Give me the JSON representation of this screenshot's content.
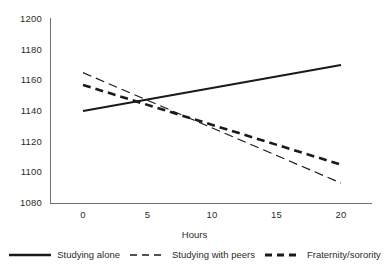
{
  "chart_data": {
    "type": "line",
    "title": "",
    "subtitle": "",
    "xlabel": "Hours",
    "ylabel": "",
    "xlim": [
      -1.5,
      22
    ],
    "ylim": [
      1080,
      1200
    ],
    "grid": false,
    "legend_position": "bottom",
    "x_ticks": [
      "0",
      "5",
      "10",
      "15",
      "20"
    ],
    "x_tick_values": [
      0,
      5,
      10,
      15,
      20
    ],
    "y_ticks": [
      "1080",
      "1100",
      "1120",
      "1140",
      "1160",
      "1180",
      "1200"
    ],
    "y_tick_values": [
      1080,
      1100,
      1120,
      1140,
      1160,
      1180,
      1200
    ],
    "x": [
      0,
      20
    ],
    "series": [
      {
        "name": "Studying alone",
        "style": "solid",
        "color": "#1a1a1a",
        "width": 2.2,
        "values": [
          1140,
          1170
        ]
      },
      {
        "name": "Studying with peers",
        "style": "dashed-thin",
        "color": "#1a1a1a",
        "width": 1.2,
        "values": [
          1165,
          1093
        ]
      },
      {
        "name": "Fraternity/sorority",
        "style": "dashed-thick",
        "color": "#1a1a1a",
        "width": 2.6,
        "values": [
          1157,
          1105
        ]
      }
    ]
  },
  "axes": {
    "x_title": "Hours",
    "y_tick_0": "1200",
    "y_tick_1": "1180",
    "y_tick_2": "1160",
    "y_tick_3": "1140",
    "y_tick_4": "1120",
    "y_tick_5": "1100",
    "y_tick_6": "1080",
    "x_tick_0": "0",
    "x_tick_1": "5",
    "x_tick_2": "10",
    "x_tick_3": "15",
    "x_tick_4": "20"
  },
  "legend": {
    "item_0_label": "Studying alone",
    "item_1_label": "Studying with peers",
    "item_2_label": "Fraternity/sorority"
  }
}
